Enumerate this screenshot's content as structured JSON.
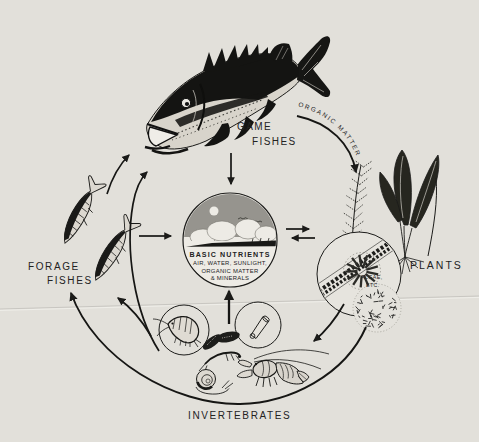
{
  "diagram": {
    "type": "cycle-diagram",
    "colors": {
      "paper": "#e2e0da",
      "ink": "#1b1b19",
      "sky_gray": "#96948e"
    },
    "nodes": {
      "game_fishes": {
        "line1": "GAME",
        "line2": "FISHES"
      },
      "forage_fishes": {
        "line1": "FORAGE",
        "line2": "FISHES"
      },
      "plants": {
        "label": "PLANTS"
      },
      "algae": {
        "line1": "ALGAE,",
        "line2": "ETC."
      },
      "invertebrates": {
        "label": "INVERTEBRATES"
      },
      "basic_nutrients": {
        "title": "BASIC NUTRIENTS",
        "line1": "AIR, WATER, SUNLIGHT,",
        "line2": "ORGANIC MATTER",
        "line3": "& MINERALS"
      }
    },
    "flows": [
      {
        "from": "game_fishes",
        "to": "plants",
        "label": "ORGANIC MATTER"
      },
      {
        "from": "game_fishes",
        "to": "basic_nutrients",
        "label": ""
      },
      {
        "from": "invertebrates",
        "to": "basic_nutrients",
        "label": ""
      },
      {
        "from": "forage_fishes",
        "to": "basic_nutrients",
        "label": ""
      },
      {
        "from": "basic_nutrients",
        "to": "algae",
        "label": ""
      },
      {
        "from": "algae",
        "to": "basic_nutrients",
        "label": ""
      },
      {
        "from": "algae",
        "to": "invertebrates",
        "label": ""
      },
      {
        "from": "invertebrates",
        "to": "forage_fishes",
        "label": ""
      },
      {
        "from": "invertebrates",
        "to": "game_fishes",
        "label": ""
      },
      {
        "from": "forage_fishes",
        "to": "game_fishes",
        "label": ""
      },
      {
        "from": "plants",
        "to": "forage_fishes",
        "label": ""
      }
    ]
  }
}
